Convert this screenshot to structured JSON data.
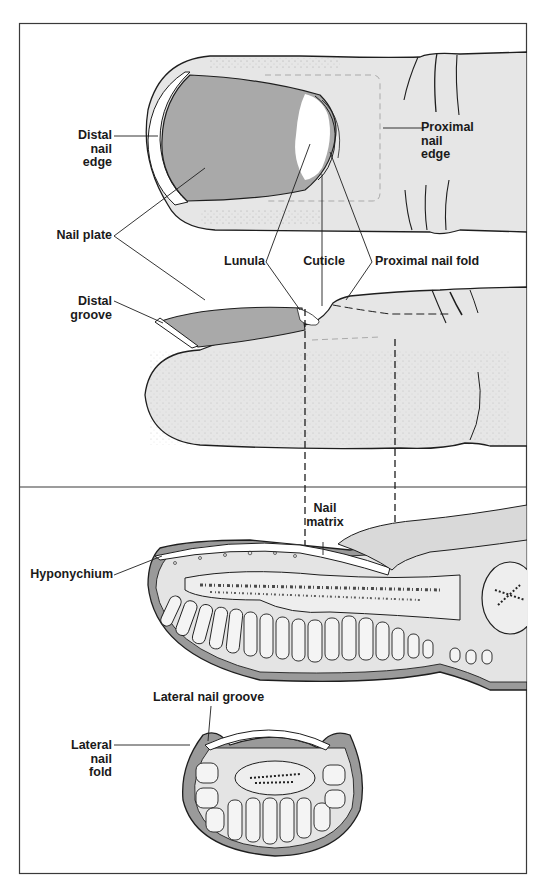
{
  "figure": {
    "panels": [
      {
        "id": "top",
        "description": "Dorsal and lateral views of fingertip"
      },
      {
        "id": "bottom",
        "description": "Longitudinal and transverse sections of fingertip"
      }
    ],
    "colors": {
      "frame": "#3a3a3a",
      "skin": "#e6e6e6",
      "nail_plate": "#a9a9a9",
      "lunula": "#ffffff",
      "outline": "#1e1e1e",
      "tissue_dark": "#9a9a9a"
    }
  },
  "labels": {
    "distal_nail_edge": "Distal\nnail\nedge",
    "proximal_nail_edge": "Proximal\nnail\nedge",
    "nail_plate": "Nail plate",
    "lunula": "Lunula",
    "cuticle": "Cuticle",
    "proximal_nail_fold": "Proximal nail fold",
    "distal_groove": "Distal\ngroove",
    "nail_matrix": "Nail\nmatrix",
    "hyponychium": "Hyponychium",
    "lateral_nail_groove": "Lateral nail groove",
    "lateral_nail_fold": "Lateral\nnail\nfold"
  }
}
